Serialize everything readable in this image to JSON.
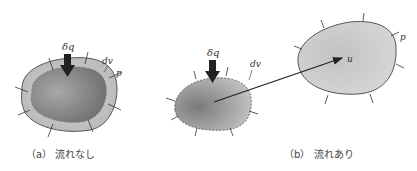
{
  "panel_a": {
    "caption": "（a） 流れなし",
    "heat_label": "δq",
    "volume_label": "dv",
    "pressure_label": "p"
  },
  "panel_b": {
    "caption": "（b） 流れあり",
    "heat_label": "δq",
    "volume_label": "dv",
    "pressure_label": "p",
    "velocity_label": "u"
  },
  "colors": {
    "outer_fill": "#c8c8c8",
    "inner_fill": "#8a8a8a",
    "outline": "#555555",
    "arrow": "#222222"
  }
}
